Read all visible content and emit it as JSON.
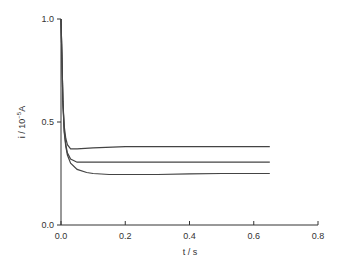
{
  "chart_data": {
    "type": "line",
    "title": "",
    "xlabel": "t / s",
    "ylabel": "i / 10^-5 A",
    "ylabel_parts": {
      "prefix": "i  /  10",
      "exp": "−5",
      "suffix": "A"
    },
    "xlim": [
      0.0,
      0.8
    ],
    "ylim": [
      0.0,
      1.0
    ],
    "xticks": [
      "0.0",
      "0.2",
      "0.4",
      "0.6",
      "0.8"
    ],
    "yticks": [
      "0.0",
      "0.5",
      "1.0"
    ],
    "grid": false,
    "legend": null,
    "series": [
      {
        "name": "curve-1",
        "x": [
          0.0,
          0.003,
          0.006,
          0.01,
          0.015,
          0.02,
          0.03,
          0.05,
          0.1,
          0.2,
          0.3,
          0.4,
          0.5,
          0.65
        ],
        "y": [
          1.0,
          0.8,
          0.6,
          0.48,
          0.42,
          0.39,
          0.37,
          0.37,
          0.375,
          0.38,
          0.38,
          0.38,
          0.38,
          0.38
        ]
      },
      {
        "name": "curve-2",
        "x": [
          0.0,
          0.003,
          0.006,
          0.01,
          0.015,
          0.02,
          0.03,
          0.05,
          0.1,
          0.2,
          0.3,
          0.4,
          0.5,
          0.65
        ],
        "y": [
          1.0,
          0.8,
          0.6,
          0.46,
          0.39,
          0.35,
          0.32,
          0.305,
          0.305,
          0.305,
          0.305,
          0.305,
          0.305,
          0.305
        ]
      },
      {
        "name": "curve-3",
        "x": [
          0.0,
          0.003,
          0.006,
          0.01,
          0.015,
          0.02,
          0.03,
          0.05,
          0.08,
          0.1,
          0.15,
          0.2,
          0.3,
          0.4,
          0.5,
          0.65
        ],
        "y": [
          1.0,
          0.8,
          0.6,
          0.45,
          0.38,
          0.34,
          0.3,
          0.27,
          0.255,
          0.25,
          0.245,
          0.245,
          0.245,
          0.248,
          0.25,
          0.25
        ]
      }
    ]
  }
}
